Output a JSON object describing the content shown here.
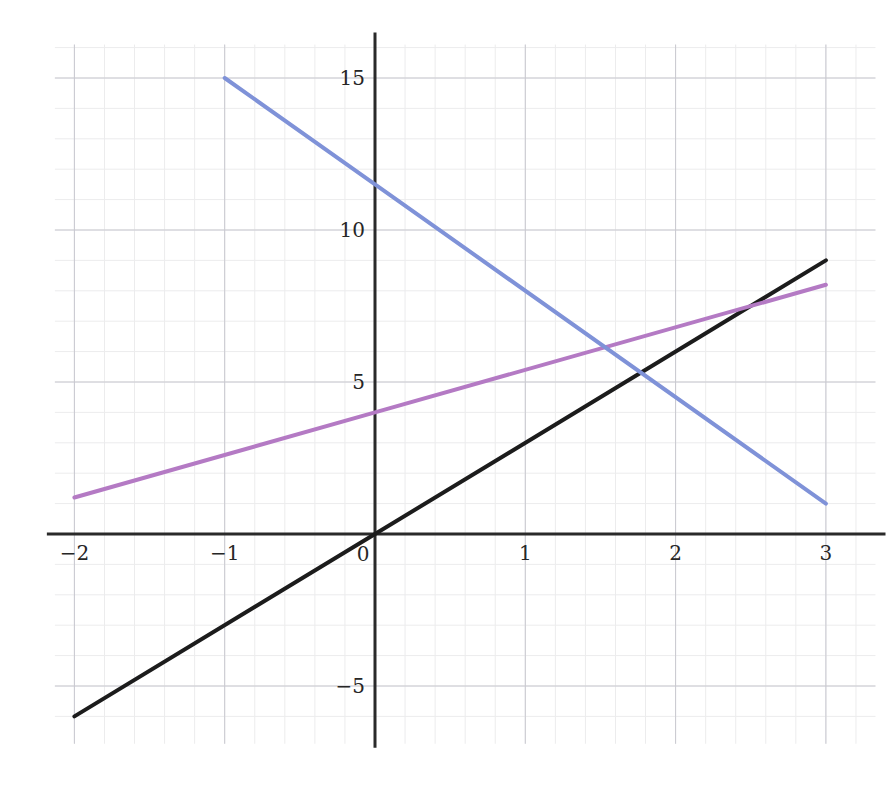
{
  "chart_data": {
    "type": "line",
    "title": "",
    "subtitle": "",
    "xlabel": "",
    "ylabel": "",
    "xlim": [
      -2.13,
      3.33
    ],
    "ylim": [
      -6.9,
      16.1
    ],
    "grid": true,
    "grid_major_step_x": 1,
    "grid_major_step_y": 5,
    "grid_minor_step_x": 0.2,
    "grid_minor_step_y": 1,
    "legend": "none",
    "xticks": [
      -2,
      -1,
      0,
      1,
      2,
      3
    ],
    "xtick_labels": [
      "−2",
      "−1",
      "0",
      "1",
      "2",
      "3"
    ],
    "yticks": [
      -5,
      5,
      10,
      15
    ],
    "ytick_labels": [
      "−5",
      "5",
      "10",
      "15"
    ],
    "axes_drawn": [
      "x-axis at y=0",
      "y-axis at x=0"
    ],
    "series": [
      {
        "name": "black-line",
        "color": "#1c1c1c",
        "width": 4,
        "equation": "y = 3x",
        "slope": 3,
        "intercept": 0,
        "x": [
          -2,
          3
        ],
        "values": [
          -6,
          9
        ],
        "points": [
          [
            -2,
            -6
          ],
          [
            0,
            0
          ],
          [
            3,
            9
          ]
        ]
      },
      {
        "name": "purple-line",
        "color": "#b47ac4",
        "width": 4,
        "equation": "y = 1.4x + 4",
        "slope": 1.4,
        "intercept": 4,
        "x": [
          -2,
          3
        ],
        "values": [
          1.2,
          8.2
        ],
        "points": [
          [
            -2,
            1.2
          ],
          [
            0,
            4
          ],
          [
            3,
            8.2
          ]
        ]
      },
      {
        "name": "blue-line",
        "color": "#7f92d8",
        "width": 4,
        "equation": "y = -3.5x + 11.5",
        "slope": -3.5,
        "intercept": 11.5,
        "x": [
          -1,
          3
        ],
        "values": [
          15,
          1
        ],
        "points": [
          [
            -1,
            15
          ],
          [
            0,
            11.5
          ],
          [
            3,
            1
          ]
        ]
      }
    ],
    "intersections": [
      {
        "label": "purple-blue",
        "x": 1.53,
        "y": 6.14
      },
      {
        "label": "black-blue",
        "x": 1.77,
        "y": 5.31
      },
      {
        "label": "black-purple",
        "x": 2.5,
        "y": 7.5
      }
    ],
    "colors": {
      "background": "#ffffff",
      "axis": "#2a2a2a",
      "grid_major": "#c8c8cf",
      "grid_minor": "#ececed",
      "tick_text": "#262626"
    }
  }
}
